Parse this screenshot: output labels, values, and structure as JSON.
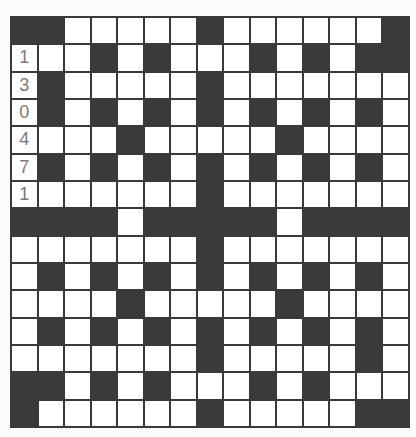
{
  "puzzle": {
    "type": "crossword",
    "rows": 15,
    "cols": 15,
    "colors": {
      "block": "#3a3a3a",
      "cell": "#ffffff",
      "clue_digit": "#7a7a7a",
      "background": "#fbfbfb"
    },
    "legend": "W = white cell, B = black cell, digit = pre-filled digit cell",
    "layout": [
      "BBWWWWWBWWWWWWB",
      "1WWBWBWWWBWBWBB",
      "3BWWWWWBWWWWWWW",
      "0BWBWBWBWBWBWBW",
      "4WWWBWWWWWBWWWW",
      "7BWBWBWBWBWBWBW",
      "1WWWWWWBWWWWWWW",
      "BBBBWBBBBBWBBBB",
      "WWWWWWWBWWWWWWW",
      "WBWBWBWBWBWBWBW",
      "WWWWBWWWWWBWWWW",
      "WBWBWBWBWBWBWBW",
      "WWWWWWWBWWWWWBW",
      "BBWBWBWWWBWBWWW",
      "BWWWWWWBWWWWWBB"
    ],
    "given_digits": [
      "1",
      "3",
      "0",
      "4",
      "7",
      "1"
    ]
  }
}
